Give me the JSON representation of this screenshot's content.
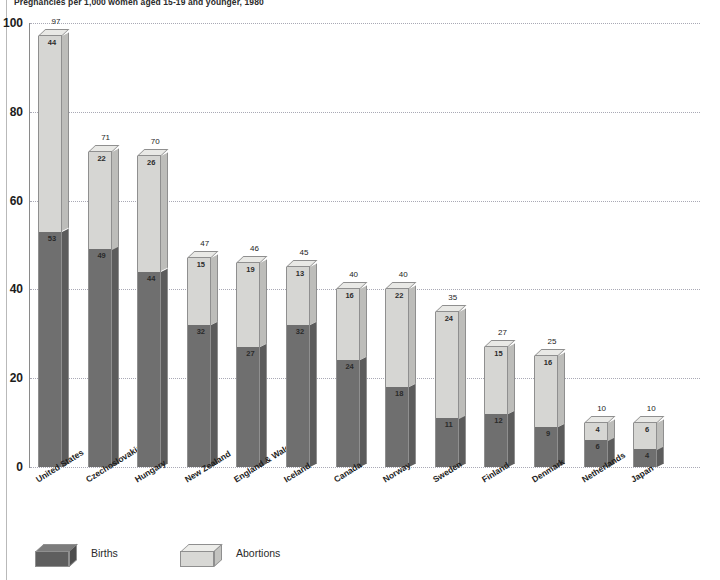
{
  "chart_data": {
    "type": "bar",
    "subtype": "stacked-3d-column",
    "title": "Pregnancies per 1,000 women aged 15-19 and younger, 1980",
    "xlabel": "",
    "ylabel": "",
    "ylim": [
      0,
      100
    ],
    "yticks": [
      0,
      20,
      40,
      60,
      80,
      100
    ],
    "grid": true,
    "legend_position": "bottom-left",
    "categories": [
      "United States",
      "Czechoslovakia",
      "Hungary",
      "New Zealand",
      "England & Wales",
      "Iceland",
      "Canada",
      "Norway",
      "Sweden",
      "Finland",
      "Denmark",
      "Netherlands",
      "Japan"
    ],
    "series": [
      {
        "name": "Births",
        "color": "#6f6f6f",
        "values": [
          53,
          49,
          44,
          32,
          27,
          32,
          24,
          18,
          11,
          12,
          9,
          6,
          4
        ]
      },
      {
        "name": "Abortions",
        "color": "#d6d6d3",
        "values": [
          44,
          22,
          26,
          15,
          19,
          13,
          16,
          22,
          24,
          15,
          16,
          4,
          6
        ]
      }
    ],
    "totals": [
      97,
      71,
      70,
      47,
      46,
      45,
      40,
      40,
      35,
      27,
      25,
      10,
      10
    ]
  },
  "legend": {
    "items": [
      {
        "label": "Births",
        "swatch": "births-swatch"
      },
      {
        "label": "Abortions",
        "swatch": "abortions-swatch"
      }
    ]
  }
}
